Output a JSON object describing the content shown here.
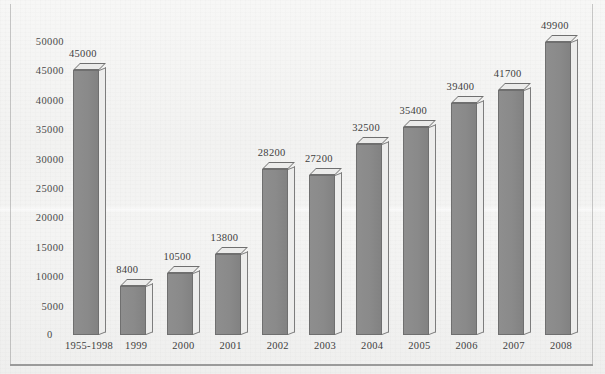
{
  "chart_data": {
    "type": "bar",
    "title": "",
    "xlabel": "",
    "ylabel": "",
    "categories": [
      "1955-1998",
      "1999",
      "2000",
      "2001",
      "2002",
      "2003",
      "2004",
      "2005",
      "2006",
      "2007",
      "2008"
    ],
    "values": [
      45000,
      8400,
      10500,
      13800,
      28200,
      27200,
      32500,
      35400,
      39400,
      41700,
      49900
    ],
    "value_labels": [
      "45000",
      "8400",
      "10500",
      "13800",
      "28200",
      "27200",
      "32500",
      "35400",
      "39400",
      "41700",
      "49900"
    ],
    "ylim": [
      0,
      50000
    ],
    "ytick_values": [
      0,
      5000,
      10000,
      15000,
      20000,
      25000,
      30000,
      35000,
      40000,
      45000,
      50000
    ],
    "ytick_labels": [
      "0",
      "5000",
      "10000",
      "15000",
      "20000",
      "25000",
      "30000",
      "35000",
      "40000",
      "45000",
      "50000"
    ],
    "grid": false,
    "legend": null,
    "legend_position": "none",
    "style": "3d-bars-grayscale-scanned-page"
  },
  "colors": {
    "background": "#f2f2f1",
    "bar_front": "#8a8a8a",
    "bar_top": "#ebebea",
    "bar_side": "#ededec",
    "bar_outline": "#6f6f6f",
    "text": "#3e3e3e",
    "frame_line": "#9a9a9a"
  }
}
